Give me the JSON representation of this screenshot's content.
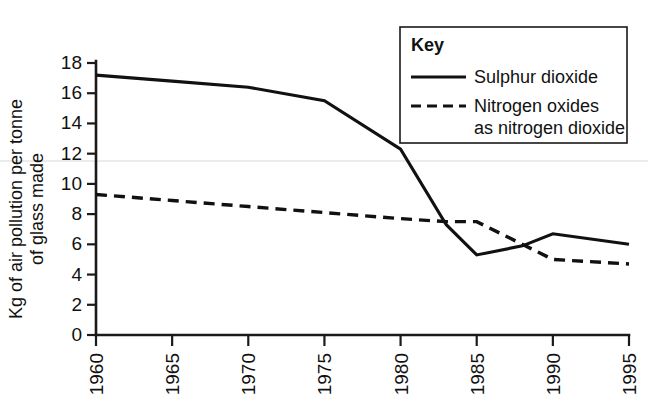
{
  "chart_data": {
    "type": "line",
    "title": "",
    "xlabel": "",
    "ylabel": "Kg of air pollution per tonne of glass made",
    "ylabel_lines": [
      "Kg of air pollution per tonne",
      "of glass made"
    ],
    "xlim": [
      1960,
      1995
    ],
    "ylim": [
      0,
      18
    ],
    "y_ticks": [
      0,
      2,
      4,
      6,
      8,
      10,
      12,
      14,
      16,
      18
    ],
    "y_tick_labels": [
      "0",
      "2",
      "4",
      "6",
      "8",
      "10",
      "12",
      "14",
      "16",
      "18"
    ],
    "x_ticks": [
      1960,
      1965,
      1970,
      1975,
      1980,
      1985,
      1990,
      1995
    ],
    "x_tick_labels": [
      "1960",
      "1965",
      "1970",
      "1975",
      "1980",
      "1985",
      "1990",
      "1995"
    ],
    "x_tick_rotation": -90,
    "grid": false,
    "legend_position": "top-right",
    "legend_title": "Key",
    "series": [
      {
        "name": "Sulphur dioxide",
        "style": "solid",
        "color": "#111111",
        "x": [
          1960,
          1965,
          1970,
          1975,
          1980,
          1983,
          1985,
          1988,
          1990,
          1995
        ],
        "values": [
          17.2,
          16.8,
          16.4,
          15.5,
          12.3,
          7.3,
          5.3,
          5.9,
          6.7,
          6.0
        ]
      },
      {
        "name": "Nitrogen oxides as nitrogen dioxide",
        "style": "dashed",
        "color": "#111111",
        "x": [
          1960,
          1965,
          1970,
          1975,
          1980,
          1983,
          1985,
          1990,
          1995
        ],
        "values": [
          9.3,
          8.9,
          8.5,
          8.1,
          7.7,
          7.5,
          7.5,
          5.0,
          4.7
        ]
      }
    ]
  },
  "legend": {
    "title": "Key",
    "entries": [
      {
        "label": "Sulphur dioxide",
        "style": "solid"
      },
      {
        "label_line1": "Nitrogen oxides",
        "label_line2": "as nitrogen dioxide",
        "style": "dashed"
      }
    ]
  }
}
